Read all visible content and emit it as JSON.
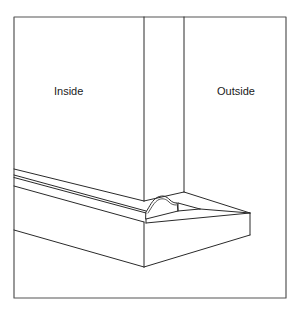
{
  "diagram": {
    "labels": {
      "inside": "Inside",
      "outside": "Outside"
    },
    "colors": {
      "line": "#2a2a2a",
      "frame": "#555555",
      "background": "#ffffff"
    }
  }
}
